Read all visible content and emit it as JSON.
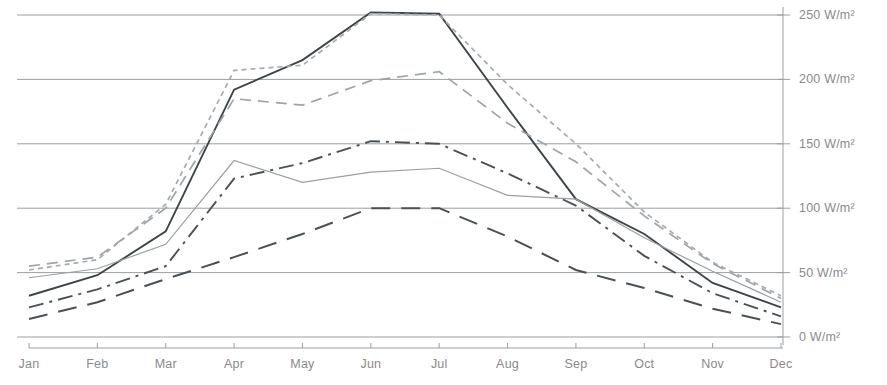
{
  "chart_data": {
    "type": "line",
    "title": "",
    "subtitle": "",
    "xlabel": "",
    "ylabel": "",
    "unit": "W/m²",
    "categories": [
      "Jan",
      "Feb",
      "Mar",
      "Apr",
      "May",
      "Jun",
      "Jul",
      "Aug",
      "Sep",
      "Oct",
      "Nov",
      "Dec"
    ],
    "x_tick_labels": [
      "Jan",
      "Feb",
      "Mar",
      "Apr",
      "May",
      "Jun",
      "Jul",
      "Aug",
      "Sep",
      "Oct",
      "Nov",
      "Dec"
    ],
    "y_tick_labels": [
      "0 W/m²",
      "50 W/m²",
      "100 W/m²",
      "150 W/m²",
      "200 W/m²",
      "250 W/m²"
    ],
    "y_tick_values": [
      0,
      50,
      100,
      150,
      200,
      250
    ],
    "ylim": [
      0,
      255
    ],
    "xlim": [
      "Jan",
      "Dec"
    ],
    "grid": "horizontal",
    "legend": "none",
    "series": [
      {
        "name": "series-1-solid-dark",
        "style": "solid",
        "color": "#3d4448",
        "width": 1.9,
        "values": [
          32,
          48,
          82,
          192,
          215,
          252,
          251,
          178,
          107,
          80,
          42,
          23
        ]
      },
      {
        "name": "series-2-dotted-gray",
        "style": "dotted",
        "color": "#a6abaf",
        "width": 1.7,
        "values": [
          52,
          60,
          103,
          207,
          211,
          251,
          250,
          196,
          150,
          97,
          58,
          32
        ]
      },
      {
        "name": "series-3-dashed-gray",
        "style": "dashed",
        "color": "#9ea4a8",
        "width": 1.7,
        "values": [
          55,
          62,
          100,
          185,
          180,
          199,
          206,
          166,
          136,
          94,
          57,
          30
        ]
      },
      {
        "name": "series-4-thin-gray-solid",
        "style": "solid",
        "color": "#9a9fa3",
        "width": 1.2,
        "values": [
          46,
          53,
          72,
          137,
          120,
          128,
          131,
          110,
          107,
          77,
          51,
          27
        ]
      },
      {
        "name": "series-5-dash-dot",
        "style": "dash-dot",
        "color": "#4a5155",
        "width": 1.9,
        "values": [
          23,
          37,
          55,
          123,
          135,
          152,
          150,
          127,
          102,
          63,
          34,
          16
        ]
      },
      {
        "name": "series-6-long-dash",
        "style": "long-dash",
        "color": "#4a5155",
        "width": 2.0,
        "values": [
          14,
          27,
          45,
          62,
          80,
          100,
          100,
          78,
          52,
          38,
          22,
          10
        ]
      }
    ],
    "colors": {
      "gridline": "#9a9fa3",
      "axis": "#9a9fa3",
      "tick_text": "#8a8a8a",
      "background": "#ffffff"
    }
  },
  "axes": {
    "y_axis_name": "y-axis",
    "x_axis_name": "x-axis"
  }
}
